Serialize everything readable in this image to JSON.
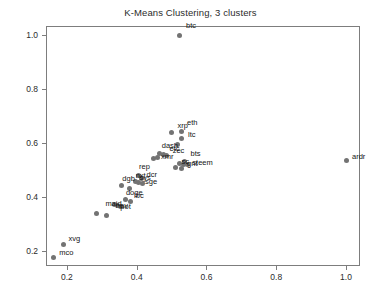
{
  "chart_data": {
    "type": "scatter",
    "title": "K-Means Clustering, 3 clusters",
    "xlabel": "",
    "ylabel": "",
    "xlim": [
      0.14,
      1.04
    ],
    "ylim": [
      0.145,
      1.035
    ],
    "xticks": [
      0.2,
      0.4,
      0.6,
      0.8,
      1.0
    ],
    "yticks": [
      0.2,
      0.4,
      0.6,
      0.8,
      1.0
    ],
    "xtick_labels": [
      "0.2",
      "0.4",
      "0.6",
      "0.8",
      "1.0"
    ],
    "ytick_labels": [
      "0.2",
      "0.4",
      "0.6",
      "0.8",
      "1.0"
    ],
    "grid": false,
    "legend": false,
    "marker_color": "#737373",
    "points": [
      {
        "label": "btc",
        "x": 0.524,
        "y": 1.0,
        "lx": 6,
        "ly": -9
      },
      {
        "label": "ardr",
        "x": 1.0,
        "y": 0.536,
        "lx": 6,
        "ly": -4
      },
      {
        "label": "xrp",
        "x": 0.5,
        "y": 0.64,
        "lx": 6,
        "ly": -7
      },
      {
        "label": "eth",
        "x": 0.527,
        "y": 0.645,
        "lx": 6,
        "ly": -8
      },
      {
        "label": "ltc",
        "x": 0.527,
        "y": 0.617,
        "lx": 7,
        "ly": -4
      },
      {
        "label": "",
        "x": 0.516,
        "y": 0.597,
        "lx": 0,
        "ly": 0
      },
      {
        "label": "dash",
        "x": 0.466,
        "y": 0.563,
        "lx": 2,
        "ly": -7
      },
      {
        "label": "etc",
        "x": 0.477,
        "y": 0.558,
        "lx": 6,
        "ly": -6
      },
      {
        "label": "zec",
        "x": 0.486,
        "y": 0.556,
        "lx": 6,
        "ly": -4
      },
      {
        "label": "xmr",
        "x": 0.461,
        "y": 0.548,
        "lx": 3,
        "ly": 0
      },
      {
        "label": "",
        "x": 0.447,
        "y": 0.545,
        "lx": 0,
        "ly": 0
      },
      {
        "label": "bts",
        "x": 0.537,
        "y": 0.533,
        "lx": 6,
        "ly": -7
      },
      {
        "label": "sc",
        "x": 0.523,
        "y": 0.524,
        "lx": 2,
        "ly": -2
      },
      {
        "label": "gnt",
        "x": 0.533,
        "y": 0.52,
        "lx": 4,
        "ly": -1
      },
      {
        "label": "steem",
        "x": 0.545,
        "y": 0.522,
        "lx": 5,
        "ly": -1
      },
      {
        "label": "",
        "x": 0.511,
        "y": 0.512,
        "lx": 0,
        "ly": 0
      },
      {
        "label": "",
        "x": 0.528,
        "y": 0.505,
        "lx": 0,
        "ly": 0
      },
      {
        "label": "rep",
        "x": 0.404,
        "y": 0.479,
        "lx": 1,
        "ly": -9
      },
      {
        "label": "dcr",
        "x": 0.414,
        "y": 0.471,
        "lx": 5,
        "ly": -3
      },
      {
        "label": "dgb",
        "x": 0.356,
        "y": 0.443,
        "lx": 1,
        "ly": -7
      },
      {
        "label": "nxt",
        "x": 0.397,
        "y": 0.458,
        "lx": 0,
        "ly": -6
      },
      {
        "label": "sys",
        "x": 0.405,
        "y": 0.455,
        "lx": 1,
        "ly": -4
      },
      {
        "label": "sge",
        "x": 0.418,
        "y": 0.452,
        "lx": 2,
        "ly": -1
      },
      {
        "label": "",
        "x": 0.378,
        "y": 0.433,
        "lx": 0,
        "ly": 0
      },
      {
        "label": "doge",
        "x": 0.369,
        "y": 0.391,
        "lx": 0,
        "ly": -7
      },
      {
        "label": "lbc",
        "x": 0.381,
        "y": 0.386,
        "lx": 4,
        "ly": -5
      },
      {
        "label": "maid",
        "x": 0.336,
        "y": 0.372,
        "lx": -9,
        "ly": -1
      },
      {
        "label": "nav",
        "x": 0.346,
        "y": 0.369,
        "lx": -2,
        "ly": 0
      },
      {
        "label": "pot",
        "x": 0.353,
        "y": 0.366,
        "lx": 0,
        "ly": 1
      },
      {
        "label": "",
        "x": 0.285,
        "y": 0.34,
        "lx": 0,
        "ly": 0
      },
      {
        "label": "",
        "x": 0.313,
        "y": 0.333,
        "lx": 0,
        "ly": 0
      },
      {
        "label": "xvg",
        "x": 0.19,
        "y": 0.224,
        "lx": 5,
        "ly": -6
      },
      {
        "label": "mco",
        "x": 0.161,
        "y": 0.178,
        "lx": 6,
        "ly": -4
      }
    ]
  }
}
